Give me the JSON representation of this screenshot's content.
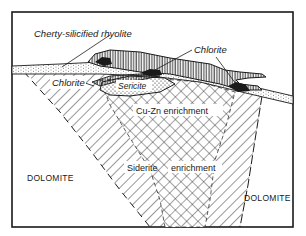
{
  "diagram": {
    "type": "geological cross-section",
    "labels": {
      "cherty_rhyolite": "Cherty-silicified rhyolite",
      "chlorite_left": "Chlorite",
      "chlorite_top": "Chlorite",
      "sericite": "Sericite",
      "cu_zn": "Cu-Zn enrichment",
      "siderite": "Siderite",
      "siderite_enrichment": "enrichment",
      "dolomite_left": "DOLOMITE",
      "dolomite_right": "DOLOMITE"
    },
    "units": [
      {
        "name": "Cherty-silicified rhyolite",
        "pattern": "stippled band"
      },
      {
        "name": "Chlorite",
        "pattern": "diagonal hatching"
      },
      {
        "name": "Sericite",
        "pattern": "dots"
      },
      {
        "name": "Cu-Zn enrichment",
        "pattern": "cross-hatch"
      },
      {
        "name": "Siderite enrichment",
        "pattern": "cross-hatch"
      },
      {
        "name": "Massive sulfide lens",
        "pattern": "vertical lines"
      },
      {
        "name": "Dolomite",
        "pattern": "blank"
      }
    ],
    "colors": {
      "ink": "#1a1a1a",
      "paper": "#ffffff"
    }
  }
}
